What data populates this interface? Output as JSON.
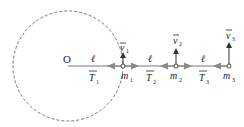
{
  "diagram": {
    "center_label": "O",
    "colors": {
      "ink": "#333333",
      "rod": "#777777",
      "tension_arrow": "#8a8a8a",
      "circle": "#555555"
    },
    "segments": [
      {
        "length_label": "ℓ",
        "tension_label": "T",
        "tension_sub": "1"
      },
      {
        "length_label": "ℓ",
        "tension_label": "T",
        "tension_sub": "2"
      },
      {
        "length_label": "ℓ",
        "tension_label": "T",
        "tension_sub": "3"
      }
    ],
    "masses": [
      {
        "label": "m",
        "sub": "1",
        "velocity_label": "v",
        "velocity_sub": "1"
      },
      {
        "label": "m",
        "sub": "2",
        "velocity_label": "v",
        "velocity_sub": "2"
      },
      {
        "label": "m",
        "sub": "3",
        "velocity_label": "v",
        "velocity_sub": "3"
      }
    ]
  }
}
